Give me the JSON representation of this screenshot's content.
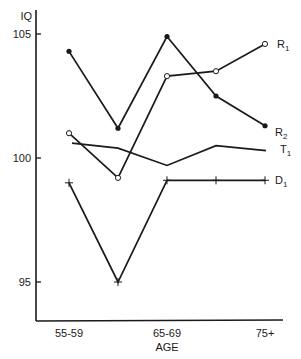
{
  "chart_data": {
    "type": "line",
    "title": "",
    "xlabel": "AGE",
    "ylabel": "IQ",
    "categories": [
      "55-59",
      "60-64",
      "65-69",
      "70-74",
      "75+"
    ],
    "x_tick_labels": [
      "55-59",
      "65-69",
      "75+"
    ],
    "y_ticks": [
      95,
      100,
      105
    ],
    "ylim": [
      92.5,
      106.1
    ],
    "grid": false,
    "legend_position": "inline-right",
    "series": [
      {
        "name": "R1",
        "marker": "open-circle",
        "values": [
          101.0,
          99.2,
          103.3,
          103.5,
          104.6
        ]
      },
      {
        "name": "R2",
        "marker": "filled-circle",
        "values": [
          104.3,
          101.2,
          104.9,
          102.5,
          101.3
        ]
      },
      {
        "name": "T1",
        "marker": "none",
        "values": [
          100.6,
          100.4,
          99.7,
          100.5,
          100.3
        ]
      },
      {
        "name": "D1",
        "marker": "plus",
        "values": [
          99.0,
          95.0,
          99.1,
          99.1,
          99.1
        ]
      }
    ]
  },
  "labels": {
    "y_axis_title": "IQ",
    "x_axis_title": "AGE",
    "series_labels": {
      "R1": {
        "main": "R",
        "sub": "1"
      },
      "R2": {
        "main": "R",
        "sub": "2"
      },
      "T1": {
        "main": "T",
        "sub": "1"
      },
      "D1": {
        "main": "D",
        "sub": "1"
      }
    }
  },
  "colors": {
    "ink": "#1a1a1a",
    "background": "#ffffff"
  }
}
